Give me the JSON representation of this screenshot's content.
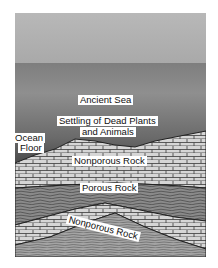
{
  "diagram": {
    "labels": {
      "sea": "Ancient Sea",
      "settling_line1": "Settling of Dead Plants",
      "settling_line2": "and Animals",
      "ocean_floor_line1": "Ocean",
      "ocean_floor_line2": "Floor",
      "nonporous_top": "Nonporous Rock",
      "porous": "Porous Rock",
      "nonporous_bottom": "Nonporous Rock"
    },
    "colors": {
      "sky": "#b0b0b0",
      "sea": "#7a7a7a",
      "rock_light": "#d8d8d8",
      "rock_dark": "#6e6e6e",
      "lines": "#333333"
    }
  }
}
